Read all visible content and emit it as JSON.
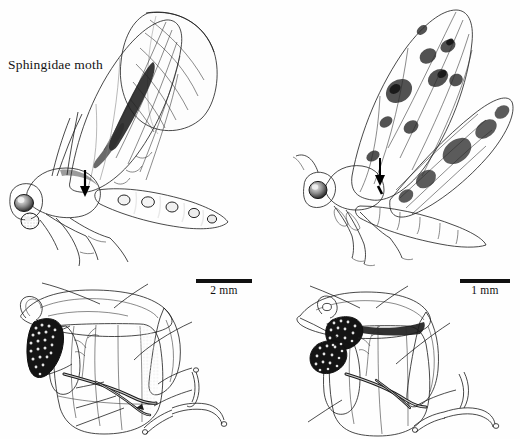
{
  "figure": {
    "background_color": "#ffffff",
    "ink_color": "#111111",
    "panels": [
      {
        "id": "sphingidae-illustration",
        "title": "Sphingidae moth",
        "type": "moth-lateral-illustration",
        "annotations": [
          {
            "kind": "arrow",
            "label": ""
          }
        ]
      },
      {
        "id": "noctuid-illustration",
        "title": "Noctuid moth",
        "type": "moth-lateral-illustration",
        "annotations": [
          {
            "kind": "arrow",
            "label": ""
          }
        ]
      },
      {
        "id": "sphingidae-thorax",
        "type": "thorax-muscle-diagram",
        "scale_bar": "2 mm"
      },
      {
        "id": "noctuid-thorax",
        "type": "thorax-muscle-diagram",
        "scale_bar": "1 mm"
      }
    ]
  },
  "titles": {
    "sphingidae": "Sphingidae moth",
    "noctuid": "Noctuid moth"
  },
  "scale_bars": {
    "left": "2 mm",
    "right": "1 mm"
  },
  "left_diagram_labels": {
    "scl3": "Scl3",
    "sc3": "Sc3",
    "dl2_upper": "dl",
    "dl2_upper_sub": "2",
    "dl2_lower": "dl",
    "dl2_lower_sub": "2",
    "nerve": "IIIN1b1",
    "dv2": "dv",
    "dv2_sub": "2",
    "dv1": "dv",
    "dv1_sub": "1",
    "dv5": "dv",
    "dv5_sub": "5",
    "dv4": "dv",
    "dv4_sub": "4",
    "dv3": "dv",
    "dv3_sub": "3"
  },
  "right_diagram_labels": {
    "scl3": "Scl3",
    "sc3": "Sc3",
    "dl1": "dl",
    "dl1_sub": "1",
    "nerve": "IIIN1b1",
    "dv1": "dv",
    "dv1_sub": "1",
    "dv3": "dv",
    "dv3_sub": "3",
    "dv5": "dv",
    "dv5_sub": "5"
  }
}
